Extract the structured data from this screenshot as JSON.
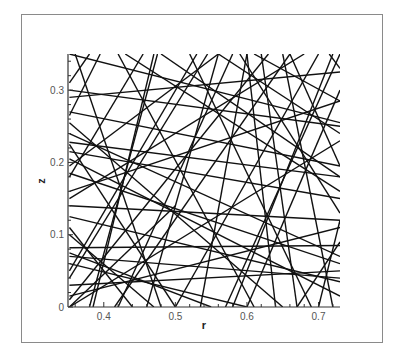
{
  "chart_data": {
    "type": "line",
    "title": "",
    "xlabel": "r",
    "ylabel": "z",
    "xlim": [
      0.35,
      0.73
    ],
    "ylim": [
      0.0,
      0.35
    ],
    "grid": false,
    "legend": null,
    "x_ticks": [
      0.4,
      0.5,
      0.6,
      0.7
    ],
    "x_tick_labels": [
      "0.4",
      "0.5",
      "0.6",
      "0.7"
    ],
    "y_ticks": [
      0,
      0.1,
      0.2,
      0.3
    ],
    "y_tick_labels": [
      "0",
      "0.1",
      "0.2",
      "0.3"
    ],
    "line_color": "#111111",
    "segments": [
      [
        0.352,
        0.3,
        0.73,
        0.25
      ],
      [
        0.352,
        0.29,
        0.73,
        0.325
      ],
      [
        0.352,
        0.228,
        0.73,
        0.18
      ],
      [
        0.352,
        0.16,
        0.73,
        0.285
      ],
      [
        0.352,
        0.14,
        0.73,
        0.12
      ],
      [
        0.352,
        0.125,
        0.73,
        0.035
      ],
      [
        0.352,
        0.082,
        0.73,
        0.085
      ],
      [
        0.352,
        0.06,
        0.6,
        0.0
      ],
      [
        0.352,
        0.03,
        0.73,
        0.05
      ],
      [
        0.352,
        0.255,
        0.65,
        0.0
      ],
      [
        0.352,
        0.195,
        0.56,
        0.35
      ],
      [
        0.352,
        0.05,
        0.53,
        0.35
      ],
      [
        0.352,
        0.015,
        0.73,
        0.11
      ],
      [
        0.352,
        0.1,
        0.47,
        0.0
      ],
      [
        0.352,
        0.24,
        0.73,
        0.07
      ],
      [
        0.352,
        0.27,
        0.73,
        0.195
      ],
      [
        0.36,
        0.35,
        0.48,
        0.0
      ],
      [
        0.38,
        0.35,
        0.352,
        0.31
      ],
      [
        0.385,
        0.0,
        0.47,
        0.35
      ],
      [
        0.395,
        0.35,
        0.352,
        0.265
      ],
      [
        0.415,
        0.0,
        0.66,
        0.35
      ],
      [
        0.42,
        0.35,
        0.61,
        0.0
      ],
      [
        0.455,
        0.35,
        0.352,
        0.18
      ],
      [
        0.46,
        0.0,
        0.56,
        0.35
      ],
      [
        0.475,
        0.35,
        0.38,
        0.0
      ],
      [
        0.48,
        0.35,
        0.73,
        0.18
      ],
      [
        0.5,
        0.0,
        0.352,
        0.225
      ],
      [
        0.52,
        0.35,
        0.69,
        0.0
      ],
      [
        0.535,
        0.0,
        0.6,
        0.35
      ],
      [
        0.545,
        0.35,
        0.352,
        0.04
      ],
      [
        0.56,
        0.35,
        0.73,
        0.24
      ],
      [
        0.57,
        0.0,
        0.73,
        0.35
      ],
      [
        0.58,
        0.35,
        0.42,
        0.0
      ],
      [
        0.59,
        0.35,
        0.73,
        0.13
      ],
      [
        0.6,
        0.0,
        0.73,
        0.3
      ],
      [
        0.62,
        0.35,
        0.67,
        0.0
      ],
      [
        0.63,
        0.35,
        0.352,
        0.01
      ],
      [
        0.64,
        0.0,
        0.6,
        0.35
      ],
      [
        0.65,
        0.35,
        0.72,
        0.0
      ],
      [
        0.66,
        0.35,
        0.73,
        0.195
      ],
      [
        0.67,
        0.0,
        0.73,
        0.09
      ],
      [
        0.68,
        0.35,
        0.352,
        0.15
      ],
      [
        0.7,
        0.0,
        0.73,
        0.12
      ],
      [
        0.7,
        0.35,
        0.5,
        0.0
      ],
      [
        0.715,
        0.35,
        0.73,
        0.33
      ],
      [
        0.72,
        0.35,
        0.58,
        0.0
      ],
      [
        0.73,
        0.255,
        0.352,
        0.35
      ],
      [
        0.73,
        0.16,
        0.43,
        0.35
      ],
      [
        0.73,
        0.015,
        0.352,
        0.205
      ],
      [
        0.73,
        0.06,
        0.352,
        0.185
      ],
      [
        0.73,
        0.23,
        0.352,
        0.0
      ],
      [
        0.352,
        0.215,
        0.73,
        0.15
      ],
      [
        0.352,
        0.07,
        0.73,
        0.04
      ],
      [
        0.44,
        0.0,
        0.352,
        0.11
      ],
      [
        0.55,
        0.0,
        0.352,
        0.075
      ],
      [
        0.352,
        0.0,
        0.5,
        0.14
      ],
      [
        0.61,
        0.35,
        0.73,
        0.285
      ]
    ]
  }
}
